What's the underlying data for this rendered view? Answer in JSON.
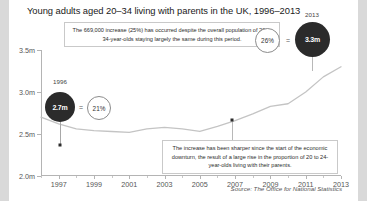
{
  "chart_title": "Young adults aged 20–34 living with parents in the UK, 1996–2013",
  "source": "Source: The Office for National Statistics",
  "annotations": {
    "top": "The 669,000 increase (25%) has occurred despite the overall population of 20 to 34-year-olds staying largely the same during this period.",
    "bottom": "The increase has been sharper since the start of the economic downturn, the result of a large rise in the proportion of 20 to 24-year-olds living with their parents."
  },
  "callouts": {
    "start": {
      "year": "1996",
      "value_label": "2.7m",
      "equals": "=",
      "share_label": "21%"
    },
    "end": {
      "year": "2013",
      "value_label": "3.3m",
      "equals": "=",
      "share_label": "26%"
    }
  },
  "chart_data": {
    "type": "line",
    "title": "Young adults aged 20–34 living with parents in the UK, 1996–2013",
    "xlabel": "",
    "ylabel": "",
    "ylim": [
      2.0,
      3.5
    ],
    "xlim": [
      1996,
      2013
    ],
    "grid": false,
    "legend": "none",
    "y_tick_labels": [
      "2.0m",
      "2.5m",
      "3.0m",
      "3.5m"
    ],
    "y_tick_values": [
      2.0,
      2.5,
      3.0,
      3.5
    ],
    "x_tick_labels": [
      "1997",
      "1999",
      "2001",
      "2003",
      "2005",
      "2007",
      "2009",
      "2011",
      "2013"
    ],
    "x_tick_values": [
      1997,
      1999,
      2001,
      2003,
      2005,
      2007,
      2009,
      2011,
      2013
    ],
    "units": "millions of young adults",
    "series": [
      {
        "name": "Young adults aged 20–34 living with parents",
        "x": [
          1996,
          1997,
          1998,
          1999,
          2000,
          2001,
          2002,
          2003,
          2004,
          2005,
          2006,
          2007,
          2008,
          2009,
          2010,
          2011,
          2012,
          2013
        ],
        "values": [
          2.7,
          2.62,
          2.56,
          2.54,
          2.53,
          2.52,
          2.56,
          2.58,
          2.56,
          2.53,
          2.59,
          2.66,
          2.74,
          2.83,
          2.86,
          3.0,
          3.18,
          3.3
        ]
      }
    ],
    "highlight_points": [
      {
        "year": 1996,
        "value": 2.7,
        "label": "2.7m",
        "share": "21%"
      },
      {
        "year": 2008,
        "value": 2.74,
        "label": "",
        "share": ""
      },
      {
        "year": 2013,
        "value": 3.3,
        "label": "3.3m",
        "share": "26%"
      }
    ]
  }
}
